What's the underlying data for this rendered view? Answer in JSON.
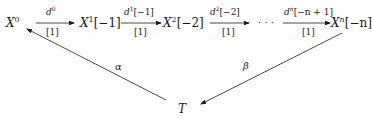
{
  "diagram": {
    "nodes": [
      {
        "id": "X0",
        "base": "X",
        "sup": "0",
        "suffix": ""
      },
      {
        "id": "X1",
        "base": "X",
        "sup": "1",
        "suffix": "[−1]"
      },
      {
        "id": "X2",
        "base": "X",
        "sup": "2",
        "suffix": "[−2]"
      },
      {
        "id": "dots",
        "text": "· · ·"
      },
      {
        "id": "Xn",
        "base": "X",
        "sup": "n",
        "suffix": "[−n]"
      },
      {
        "id": "T",
        "base": "T"
      }
    ],
    "edges": [
      {
        "from": "X0",
        "to": "X1",
        "top_base": "d",
        "top_sup": "0",
        "top_suffix": "",
        "bottom": "[1]"
      },
      {
        "from": "X1",
        "to": "X2",
        "top_base": "d",
        "top_sup": "1",
        "top_suffix": "[−1]",
        "bottom": "[1]"
      },
      {
        "from": "X2",
        "to": "dots",
        "top_base": "d",
        "top_sup": "2",
        "top_suffix": "[−2]",
        "bottom": "[1]"
      },
      {
        "from": "dots",
        "to": "Xn",
        "top_base": "d",
        "top_sup": "n",
        "top_suffix": "[−n + 1]",
        "bottom": "[1]"
      },
      {
        "from": "T",
        "to": "X0",
        "label": "α"
      },
      {
        "from": "Xn",
        "to": "T",
        "label": "β"
      }
    ]
  }
}
